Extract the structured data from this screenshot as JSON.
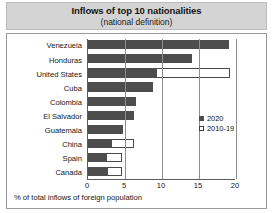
{
  "chart_data": {
    "type": "bar",
    "orientation": "horizontal",
    "title": "Inflows of top 10 nationalities",
    "subtitle": "(national definition)",
    "xlabel": "% of total inflows of foreign population",
    "ylabel": "",
    "xlim": [
      0,
      20
    ],
    "xticks": [
      0,
      5,
      10,
      15,
      20
    ],
    "xtick_labels": [
      "0",
      "5",
      "10",
      "15",
      "20"
    ],
    "grid": true,
    "grid_axis": "x",
    "legend_position": "center right",
    "categories": [
      "Venezuela",
      "Honduras",
      "United States",
      "Cuba",
      "Colombia",
      "El Salvador",
      "Guatemala",
      "China",
      "Spain",
      "Canada"
    ],
    "series": [
      {
        "name": "2020",
        "style": "filled",
        "color": "#4d4d4d",
        "values": [
          19.0,
          14.0,
          9.3,
          8.8,
          6.5,
          6.2,
          4.7,
          3.3,
          2.6,
          2.7
        ]
      },
      {
        "name": "2010-19",
        "style": "open",
        "color": "#ffffff",
        "edge_color": "#4a4a4a",
        "values": [
          19.0,
          14.0,
          19.2,
          8.8,
          6.5,
          6.2,
          4.7,
          6.2,
          4.6,
          4.6
        ]
      }
    ]
  },
  "legend": {
    "items": [
      {
        "label": "2020",
        "style": "filled"
      },
      {
        "label": "2010-19",
        "style": "open"
      }
    ]
  }
}
